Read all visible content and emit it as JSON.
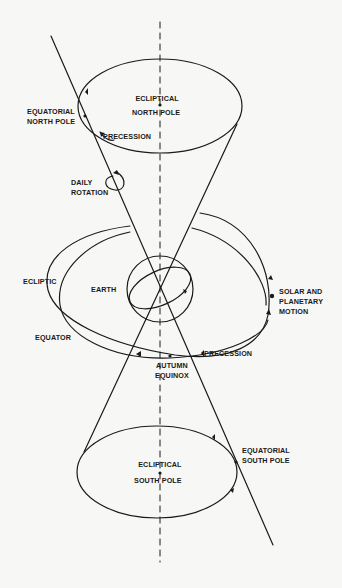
{
  "diagram": {
    "colors": {
      "background": "#f7f7f5",
      "ink": "#1a1a1a"
    },
    "labels": {
      "ecliptical_north_pole_1": "ECLIPTICAL",
      "ecliptical_north_pole_2": "NORTH POLE",
      "equatorial_north_pole_1": "EQUATORIAL",
      "equatorial_north_pole_2": "NORTH POLE",
      "precession_top": "PRECESSION",
      "daily_rotation_1": "DAILY",
      "daily_rotation_2": "ROTATION",
      "ecliptic": "ECLIPTIC",
      "earth": "EARTH",
      "solar_motion_1": "SOLAR AND",
      "solar_motion_2": "PLANETARY",
      "solar_motion_3": "MOTION",
      "equator": "EQUATOR",
      "precession_mid": "PRECESSION",
      "autumn_equinox_1": "AUTUMN",
      "autumn_equinox_2": "EQUINOX",
      "equatorial_south_pole_1": "EQUATORIAL",
      "equatorial_south_pole_2": "SOUTH POLE",
      "ecliptical_south_pole_1": "ECLIPTICAL",
      "ecliptical_south_pole_2": "SOUTH POLE"
    },
    "elements": [
      "ecliptic-axis (dashed vertical)",
      "earth-rotation-axis (tilted line)",
      "precession-cone-top",
      "precession-cone-bottom",
      "earth-sphere",
      "ecliptic-orbit",
      "celestial-equator-orbit"
    ]
  }
}
